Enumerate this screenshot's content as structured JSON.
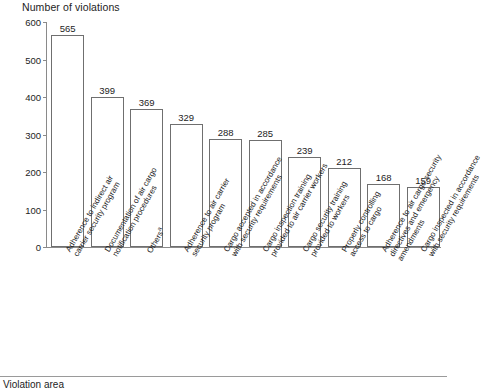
{
  "chart_data": {
    "type": "bar",
    "title": "Number of violations",
    "xlabel": "Violation area",
    "ylabel": "Number of violations",
    "ylim": [
      0,
      600
    ],
    "yticks": [
      0,
      100,
      200,
      300,
      400,
      500,
      600
    ],
    "grid": false,
    "legend": null,
    "orientation": "vertical",
    "bar_style": {
      "fill": "#ffffff",
      "edge": "#6f6f6f"
    },
    "categories": [
      "Adherence to indirect air carrier security program",
      "Documentation of air cargo notification procedures",
      "Others",
      "Adherence to air carrier security program",
      "Cargo accepted in accordance with security requirements",
      "Cargo inspection training provided to air carrier workers",
      "Cargo security training provided to workers",
      "Properly controlling access to cargo",
      "Adherence to air cargo security directives and emergency amendments",
      "Cargo inspected in accordance with security requirements"
    ],
    "category_lines": [
      [
        "Adherence to indirect air",
        "carrier security program"
      ],
      [
        "Documentation of air cargo",
        "notification procedures"
      ],
      [
        "Others"
      ],
      [
        "Adherence to air carrier",
        "security program"
      ],
      [
        "Cargo accepted in accordance",
        "with security requirements"
      ],
      [
        "Cargo inspection training",
        "provided to air carrier workers"
      ],
      [
        "Cargo security training",
        "provided to workers"
      ],
      [
        "Properly controlling",
        "access to cargo"
      ],
      [
        "Adherence to air cargo security",
        "directives and emergency",
        "amendments"
      ],
      [
        "Cargo inspected in accordance",
        "with security requirements"
      ]
    ],
    "category_footnotes": [
      "",
      "",
      "a",
      "",
      "",
      "",
      "",
      "",
      "",
      ""
    ],
    "values": [
      565,
      399,
      369,
      329,
      288,
      285,
      239,
      212,
      168,
      159
    ]
  },
  "footer": {
    "axis_caption": "Violation area"
  }
}
